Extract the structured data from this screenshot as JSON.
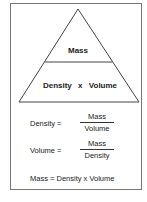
{
  "triangle": {
    "top": "Mass",
    "bottom_left": "Density",
    "operator": "x",
    "bottom_right": "Volume"
  },
  "formulas": [
    {
      "lhs": "Density =",
      "numerator": "Mass",
      "denominator": "Volume"
    },
    {
      "lhs": "Volume =",
      "numerator": "Mass",
      "denominator": "Density"
    }
  ],
  "summary": "Mass = Density x Volume"
}
